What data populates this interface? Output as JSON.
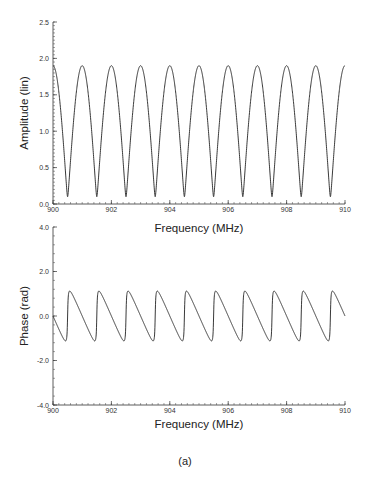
{
  "figure": {
    "caption": "(a)"
  },
  "chart_data": [
    {
      "type": "line",
      "title": "",
      "xlabel": "Frequency  (MHz)",
      "ylabel": "Amplitude  (lin)",
      "xlim": [
        900,
        910
      ],
      "ylim": [
        0.0,
        2.5
      ],
      "x_ticks": [
        900,
        902,
        904,
        906,
        908,
        910
      ],
      "x_tick_labels": [
        "900",
        "902",
        "904",
        "906",
        "908",
        "910"
      ],
      "y_ticks": [
        0.0,
        0.5,
        1.0,
        1.5,
        2.0,
        2.5
      ],
      "y_tick_labels": [
        "0.0",
        "0.5",
        "1.0",
        "1.5",
        "2.0",
        "2.5"
      ],
      "grid": false,
      "legend": null,
      "model": "|1 + 0.9·exp(-j·2π·(f-900)/1MHz)|",
      "series": [
        {
          "name": "amplitude",
          "color": "#222222",
          "x": [
            900.0,
            900.25,
            900.5,
            900.75,
            901.0,
            901.25,
            901.5,
            901.75,
            902.0,
            902.25,
            902.5,
            902.75,
            903.0,
            903.25,
            903.5,
            903.75,
            904.0,
            904.25,
            904.5,
            904.75,
            905.0,
            905.25,
            905.5,
            905.75,
            906.0,
            906.25,
            906.5,
            906.75,
            907.0,
            907.25,
            907.5,
            907.75,
            908.0,
            908.25,
            908.5,
            908.75,
            909.0,
            909.25,
            909.5,
            909.75,
            910.0
          ],
          "values": [
            1.9,
            1.345,
            0.1,
            1.345,
            1.9,
            1.345,
            0.1,
            1.345,
            1.9,
            1.345,
            0.1,
            1.345,
            1.9,
            1.345,
            0.1,
            1.345,
            1.9,
            1.345,
            0.1,
            1.345,
            1.9,
            1.345,
            0.1,
            1.345,
            1.9,
            1.345,
            0.1,
            1.345,
            1.9,
            1.345,
            0.1,
            1.345,
            1.9,
            1.345,
            0.1,
            1.345,
            1.9,
            1.345,
            0.1,
            1.345,
            1.9
          ]
        }
      ]
    },
    {
      "type": "line",
      "title": "",
      "xlabel": "Frequency  (MHz)",
      "ylabel": "Phase  (rad)",
      "xlim": [
        900,
        910
      ],
      "ylim": [
        -4.0,
        4.0
      ],
      "x_ticks": [
        900,
        902,
        904,
        906,
        908,
        910
      ],
      "x_tick_labels": [
        "900",
        "902",
        "904",
        "906",
        "908",
        "910"
      ],
      "y_ticks": [
        -4.0,
        -2.0,
        0.0,
        2.0,
        4.0
      ],
      "y_tick_labels": [
        "-4.0",
        "-2.0",
        "0.0",
        "2.0",
        "4.0"
      ],
      "grid": false,
      "legend": null,
      "model": "arg(1 + 0.9·exp(-j·2π·(f-900)/1MHz))",
      "series": [
        {
          "name": "phase",
          "color": "#222222",
          "x": [
            900.0,
            900.25,
            900.43,
            900.5,
            900.57,
            900.75,
            901.0,
            901.25,
            901.43,
            901.5,
            901.57,
            901.75,
            902.0,
            902.5,
            903.0,
            903.5,
            904.0,
            904.5,
            905.0,
            905.5,
            906.0,
            906.5,
            907.0,
            907.5,
            908.0,
            908.5,
            909.0,
            909.5,
            910.0
          ],
          "values": [
            0.0,
            -0.73,
            -1.12,
            0.0,
            1.12,
            0.73,
            0.0,
            -0.73,
            -1.12,
            0.0,
            1.12,
            0.73,
            0.0,
            0.0,
            0.0,
            0.0,
            0.0,
            0.0,
            0.0,
            0.0,
            0.0,
            0.0,
            0.0,
            0.0,
            0.0,
            0.0,
            0.0,
            0.0,
            0.0
          ],
          "period_mhz": 1.0,
          "min": -1.12,
          "max": 1.12
        }
      ]
    }
  ]
}
